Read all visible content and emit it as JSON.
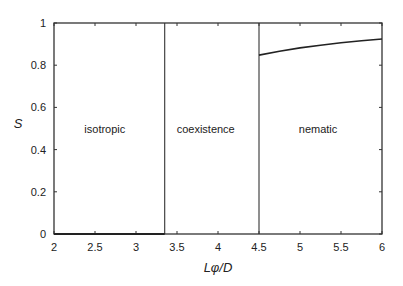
{
  "chart_data": {
    "type": "line",
    "title": "",
    "xlabel": "Lφ/D",
    "ylabel": "S",
    "xlim": [
      2,
      6
    ],
    "ylim": [
      0,
      1
    ],
    "grid": false,
    "legend": null,
    "xticks": [
      2,
      2.5,
      3,
      3.5,
      4,
      4.5,
      5,
      5.5,
      6
    ],
    "xtick_labels": [
      "2",
      "2.5",
      "3",
      "3.5",
      "4",
      "4.5",
      "5",
      "5.5",
      "6"
    ],
    "yticks": [
      0,
      0.2,
      0.4,
      0.6,
      0.8,
      1
    ],
    "ytick_labels": [
      "0",
      "0.2",
      "0.4",
      "0.6",
      "0.8",
      "1"
    ],
    "phase_boundaries": [
      3.35,
      4.5
    ],
    "regions": [
      {
        "label": "isotropic",
        "x_center": 2.62,
        "y": 0.5
      },
      {
        "label": "coexistence",
        "x_center": 3.85,
        "y": 0.5
      },
      {
        "label": "nematic",
        "x_center": 5.22,
        "y": 0.5
      }
    ],
    "series": [
      {
        "name": "isotropic branch",
        "x": [
          2.0,
          3.35
        ],
        "y": [
          0.0,
          0.0
        ]
      },
      {
        "name": "nematic branch",
        "x": [
          4.5,
          4.75,
          5.0,
          5.25,
          5.5,
          5.75,
          6.0
        ],
        "y": [
          0.848,
          0.866,
          0.882,
          0.895,
          0.906,
          0.916,
          0.924
        ]
      }
    ]
  }
}
